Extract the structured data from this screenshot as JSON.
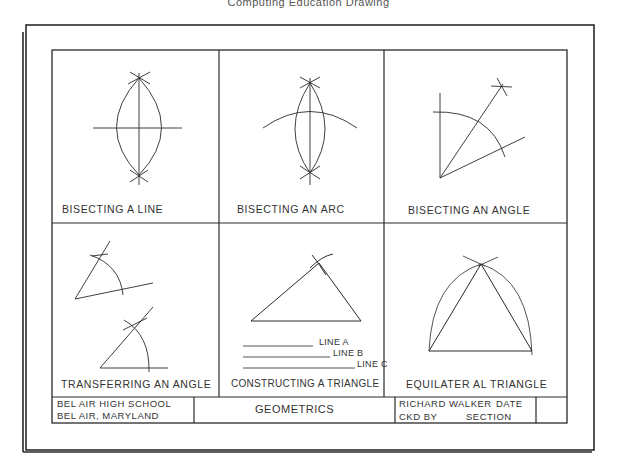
{
  "header": {
    "caption": "Computing Education Drawing"
  },
  "panels": [
    {
      "id": "bisecting-line",
      "title": "BISECTING A LINE"
    },
    {
      "id": "bisecting-arc",
      "title": "BISECTING AN ARC"
    },
    {
      "id": "bisecting-angle",
      "title": "BISECTING AN ANGLE"
    },
    {
      "id": "transferring-angle",
      "title": "TRANSFERRING AN ANGLE"
    },
    {
      "id": "constructing-triangle",
      "title": "CONSTRUCTING A TRIANGLE",
      "line_labels": [
        "LINE A",
        "LINE B",
        "LINE C"
      ]
    },
    {
      "id": "equilateral-triangle",
      "title": "EQUILATER AL TRIANGLE"
    }
  ],
  "title_block": {
    "school_line1": "BEL AIR HIGH SCHOOL",
    "school_line2": "BEL AIR, MARYLAND",
    "drawing_title": "GEOMETRICS",
    "author_line": "RICHARD WALKER",
    "date_label": "DATE",
    "checked_label": "CKD BY",
    "section_label": "SECTION"
  },
  "colors": {
    "ink": "#2a2a2a",
    "paper": "#ffffff"
  }
}
